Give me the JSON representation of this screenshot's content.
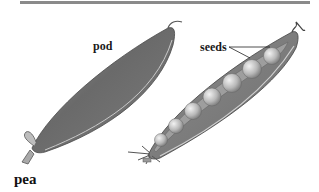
{
  "figure": {
    "title": "pea",
    "labels": {
      "pod": "pod",
      "seeds": "seeds"
    },
    "seed_count": 7,
    "colors": {
      "rule": "#8a8a8a",
      "pod_dark": "#555555",
      "pod_light": "#b5b5b5",
      "seed": "#cfcfcf",
      "text": "#1a1a1a"
    }
  }
}
